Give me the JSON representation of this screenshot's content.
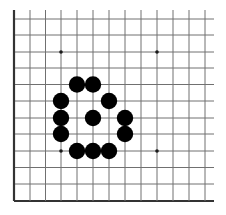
{
  "board": {
    "type": "go-diagram",
    "visible_columns": 13,
    "visible_rows": 12,
    "edges_shown": [
      "left",
      "bottom"
    ],
    "colors": {
      "background": "#ffffff",
      "line": "#707070",
      "edge": "#333333",
      "stone_black": "#000000",
      "star_point": "#1a1a1a"
    },
    "geometry": {
      "x_lines": [
        14,
        30,
        45.5,
        61,
        77,
        93,
        109,
        125,
        141,
        157,
        173,
        189,
        205
      ],
      "y_lines": [
        19,
        35,
        52,
        68,
        84.5,
        101,
        118,
        134,
        151,
        167.5,
        184,
        201
      ],
      "line_extent_right": 214,
      "line_extent_top": 10,
      "stone_radius": 8.2,
      "star_radius": 1.8
    },
    "star_points": [
      {
        "col": 3,
        "row": 2
      },
      {
        "col": 9,
        "row": 2
      },
      {
        "col": 3,
        "row": 8
      },
      {
        "col": 9,
        "row": 8
      }
    ],
    "stones": [
      {
        "color": "black",
        "col": 4,
        "row": 4
      },
      {
        "color": "black",
        "col": 5,
        "row": 4
      },
      {
        "color": "black",
        "col": 3,
        "row": 5
      },
      {
        "color": "black",
        "col": 6,
        "row": 5
      },
      {
        "color": "black",
        "col": 3,
        "row": 6
      },
      {
        "color": "black",
        "col": 5,
        "row": 6
      },
      {
        "color": "black",
        "col": 7,
        "row": 6
      },
      {
        "color": "black",
        "col": 3,
        "row": 7
      },
      {
        "color": "black",
        "col": 7,
        "row": 7
      },
      {
        "color": "black",
        "col": 4,
        "row": 8
      },
      {
        "color": "black",
        "col": 5,
        "row": 8
      },
      {
        "color": "black",
        "col": 6,
        "row": 8
      }
    ]
  }
}
